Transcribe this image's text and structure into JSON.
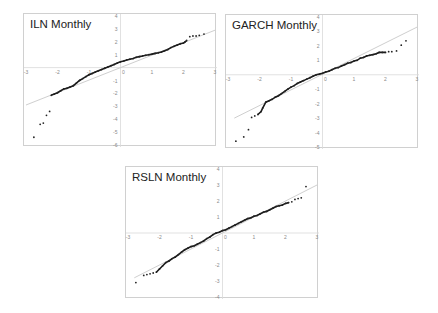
{
  "chart_data": [
    {
      "type": "scatter",
      "title": "ILN Monthly",
      "xlabel": "",
      "ylabel": "",
      "xlim": [
        -3,
        3
      ],
      "ylim": [
        -6,
        4
      ],
      "xticks": [
        -3,
        -2,
        -1,
        0,
        1,
        2,
        3
      ],
      "yticks": [
        4,
        3,
        2,
        1,
        -1,
        -2,
        -3,
        -4,
        -5,
        -6
      ],
      "grid": false,
      "reference_line": {
        "x": [
          -3,
          3
        ],
        "y": [
          -2.9,
          2.9
        ]
      },
      "points": {
        "x": [
          -2.75,
          -2.55,
          -2.45,
          -2.35,
          -2.25,
          -2.2,
          -2.1,
          -2.0,
          -1.9,
          -1.8,
          -1.7,
          -1.6,
          -1.5,
          -1.4,
          -1.3,
          -1.2,
          -1.1,
          -1.0,
          -0.9,
          -0.8,
          -0.7,
          -0.6,
          -0.5,
          -0.4,
          -0.3,
          -0.2,
          -0.1,
          0.0,
          0.1,
          0.2,
          0.3,
          0.4,
          0.5,
          0.6,
          0.7,
          0.8,
          0.9,
          1.0,
          1.1,
          1.2,
          1.3,
          1.4,
          1.5,
          1.6,
          1.7,
          1.8,
          1.9,
          2.0,
          2.05,
          2.1,
          2.2,
          2.3,
          2.4,
          2.5,
          2.65
        ],
        "y": [
          -5.4,
          -4.4,
          -4.3,
          -3.7,
          -3.4,
          -2.15,
          -2.05,
          -1.95,
          -1.8,
          -1.65,
          -1.6,
          -1.5,
          -1.4,
          -1.2,
          -1.0,
          -0.85,
          -0.7,
          -0.55,
          -0.45,
          -0.35,
          -0.25,
          -0.15,
          -0.05,
          0.05,
          0.15,
          0.25,
          0.35,
          0.45,
          0.5,
          0.6,
          0.65,
          0.7,
          0.8,
          0.85,
          0.9,
          0.95,
          1.0,
          1.05,
          1.1,
          1.15,
          1.2,
          1.3,
          1.4,
          1.55,
          1.65,
          1.75,
          1.85,
          1.9,
          2.0,
          2.1,
          2.4,
          2.45,
          2.45,
          2.5,
          2.6
        ]
      }
    },
    {
      "type": "scatter",
      "title": "GARCH Monthly",
      "xlabel": "",
      "ylabel": "",
      "xlim": [
        -3,
        3
      ],
      "ylim": [
        -5,
        4
      ],
      "xticks": [
        -3,
        -2,
        -1,
        0,
        1,
        2,
        3
      ],
      "yticks": [
        4,
        3,
        2,
        1,
        -1,
        -2,
        -3,
        -4,
        -5
      ],
      "grid": false,
      "reference_line": {
        "x": [
          -2.8,
          3
        ],
        "y": [
          -3.0,
          3.3
        ]
      },
      "points": {
        "x": [
          -2.75,
          -2.5,
          -2.35,
          -2.25,
          -2.15,
          -2.05,
          -1.95,
          -1.9,
          -1.8,
          -1.7,
          -1.6,
          -1.5,
          -1.4,
          -1.3,
          -1.2,
          -1.1,
          -1.0,
          -0.9,
          -0.8,
          -0.7,
          -0.6,
          -0.5,
          -0.4,
          -0.3,
          -0.2,
          -0.1,
          0.0,
          0.1,
          0.2,
          0.3,
          0.4,
          0.5,
          0.6,
          0.7,
          0.8,
          0.9,
          1.0,
          1.1,
          1.2,
          1.3,
          1.4,
          1.5,
          1.6,
          1.7,
          1.8,
          1.9,
          2.0,
          2.1,
          2.2,
          2.35,
          2.5,
          2.65
        ],
        "y": [
          -4.6,
          -4.3,
          -3.8,
          -2.95,
          -2.85,
          -2.75,
          -2.55,
          -2.3,
          -1.9,
          -1.8,
          -1.7,
          -1.55,
          -1.45,
          -1.3,
          -1.15,
          -1.0,
          -0.85,
          -0.75,
          -0.6,
          -0.5,
          -0.4,
          -0.3,
          -0.2,
          -0.1,
          0.0,
          0.05,
          0.1,
          0.2,
          0.25,
          0.35,
          0.45,
          0.5,
          0.6,
          0.7,
          0.8,
          0.85,
          0.95,
          1.0,
          1.15,
          1.2,
          1.3,
          1.35,
          1.4,
          1.45,
          1.55,
          1.55,
          1.55,
          1.6,
          1.6,
          1.65,
          2.05,
          2.35
        ]
      }
    },
    {
      "type": "scatter",
      "title": "RSLN Monthly",
      "xlabel": "",
      "ylabel": "",
      "xlim": [
        -3,
        3
      ],
      "ylim": [
        -4,
        4
      ],
      "xticks": [
        -3,
        -2,
        -1,
        0,
        1,
        2,
        3
      ],
      "yticks": [
        4,
        3,
        2,
        1,
        -1,
        -2,
        -3,
        -4
      ],
      "grid": false,
      "reference_line": {
        "x": [
          -2.8,
          3
        ],
        "y": [
          -2.8,
          3.0
        ]
      },
      "points": {
        "x": [
          -2.75,
          -2.5,
          -2.4,
          -2.3,
          -2.2,
          -2.1,
          -2.0,
          -1.9,
          -1.8,
          -1.7,
          -1.6,
          -1.5,
          -1.4,
          -1.3,
          -1.2,
          -1.1,
          -1.0,
          -0.9,
          -0.8,
          -0.7,
          -0.6,
          -0.5,
          -0.4,
          -0.3,
          -0.2,
          -0.1,
          0.0,
          0.1,
          0.2,
          0.3,
          0.4,
          0.5,
          0.6,
          0.7,
          0.8,
          0.9,
          1.0,
          1.1,
          1.2,
          1.3,
          1.4,
          1.5,
          1.6,
          1.7,
          1.8,
          1.9,
          2.0,
          2.1,
          2.2,
          2.3,
          2.4,
          2.5,
          2.65
        ],
        "y": [
          -3.1,
          -2.65,
          -2.6,
          -2.55,
          -2.5,
          -2.45,
          -2.25,
          -2.05,
          -1.85,
          -1.75,
          -1.6,
          -1.5,
          -1.35,
          -1.2,
          -1.05,
          -0.95,
          -0.85,
          -0.8,
          -0.7,
          -0.6,
          -0.5,
          -0.35,
          -0.25,
          -0.1,
          0.0,
          0.05,
          0.15,
          0.2,
          0.3,
          0.4,
          0.5,
          0.6,
          0.7,
          0.8,
          0.9,
          0.95,
          1.05,
          1.1,
          1.2,
          1.3,
          1.35,
          1.45,
          1.55,
          1.65,
          1.7,
          1.75,
          1.85,
          1.9,
          1.95,
          2.1,
          2.15,
          2.2,
          2.9
        ]
      }
    }
  ]
}
